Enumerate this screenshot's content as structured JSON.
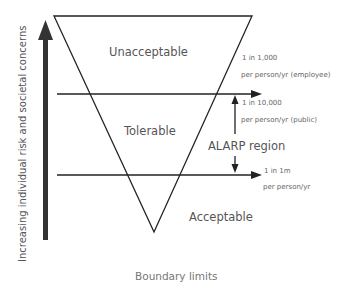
{
  "diagram": {
    "axis_label": "Increasing individual risk and societal concerns",
    "zones": {
      "unacceptable": "Unacceptable",
      "tolerable": "Tolerable",
      "acceptable": "Acceptable"
    },
    "alarp_label": "ALARP region",
    "upper_threshold": {
      "line1": "1 in 1,000",
      "line2": "per person/yr (employee)",
      "line3": "1 in 10,000",
      "line4": "per person/yr (public)"
    },
    "lower_threshold": {
      "line1": "1 in 1m",
      "line2": "per person/yr"
    },
    "footer": "Boundary limits"
  }
}
